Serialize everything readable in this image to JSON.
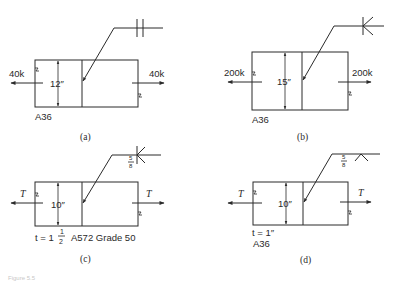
{
  "figure": {
    "panels": [
      {
        "id": "a",
        "caption": "(a)",
        "load_left": "40k",
        "load_right": "40k",
        "width_dim": "12″",
        "material": "A36",
        "thickness": "",
        "weld_symbol": "square-groove-both-sides",
        "weld_size": ""
      },
      {
        "id": "b",
        "caption": "(b)",
        "load_left": "200k",
        "load_right": "200k",
        "width_dim": "15″",
        "material": "A36",
        "thickness": "",
        "weld_symbol": "double-v-groove",
        "weld_size": ""
      },
      {
        "id": "c",
        "caption": "(c)",
        "load_left": "T",
        "load_right": "T",
        "width_dim": "10″",
        "material": "A572 Grade 50",
        "thickness_prefix": "t = 1",
        "thickness_frac_num": "1",
        "thickness_frac_den": "2",
        "weld_symbol": "double-v-groove",
        "weld_size_num": "5",
        "weld_size_den": "8"
      },
      {
        "id": "d",
        "caption": "(d)",
        "load_left": "T",
        "load_right": "T",
        "width_dim": "10″",
        "material": "A36",
        "thickness": "t = 1″",
        "weld_symbol": "single-v-groove-other-side",
        "weld_size_num": "5",
        "weld_size_den": "8"
      }
    ],
    "footer_text": "Figure 5.5"
  }
}
